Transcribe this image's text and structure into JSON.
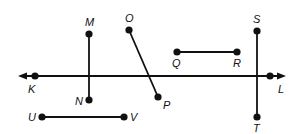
{
  "diagram": {
    "type": "geometry-lines-segments",
    "colors": {
      "stroke": "#111111",
      "background": "#ffffff"
    },
    "line": {
      "name": "KL",
      "arrows": "both",
      "y": 76,
      "x_start": 18,
      "x_end": 286,
      "points": [
        {
          "label": "K",
          "x": 35,
          "y": 76,
          "lx": 28,
          "ly": 93
        },
        {
          "label": "L",
          "x": 270,
          "y": 76,
          "lx": 278,
          "ly": 93
        }
      ]
    },
    "segments": [
      {
        "name": "MN",
        "a": {
          "label": "M",
          "x": 89,
          "y": 34,
          "lx": 85,
          "ly": 26
        },
        "b": {
          "label": "N",
          "x": 89,
          "y": 100,
          "lx": 75,
          "ly": 105
        }
      },
      {
        "name": "OP",
        "a": {
          "label": "O",
          "x": 129,
          "y": 30,
          "lx": 125,
          "ly": 22
        },
        "b": {
          "label": "P",
          "x": 158,
          "y": 97,
          "lx": 163,
          "ly": 109
        }
      },
      {
        "name": "QR",
        "a": {
          "label": "Q",
          "x": 177,
          "y": 52,
          "lx": 172,
          "ly": 67
        },
        "b": {
          "label": "R",
          "x": 237,
          "y": 52,
          "lx": 233,
          "ly": 67
        }
      },
      {
        "name": "ST",
        "a": {
          "label": "S",
          "x": 257,
          "y": 31,
          "lx": 253,
          "ly": 23
        },
        "b": {
          "label": "T",
          "x": 257,
          "y": 117,
          "lx": 253,
          "ly": 132
        }
      },
      {
        "name": "UV",
        "a": {
          "label": "U",
          "x": 42,
          "y": 117,
          "lx": 28,
          "ly": 121
        },
        "b": {
          "label": "V",
          "x": 124,
          "y": 117,
          "lx": 130,
          "ly": 121
        }
      }
    ]
  }
}
